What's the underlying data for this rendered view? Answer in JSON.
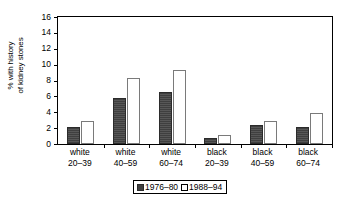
{
  "chart_data": {
    "type": "bar",
    "title": "",
    "xlabel": "",
    "ylabel": "% with history of kidney stones",
    "ylabel_line1": "% with history",
    "ylabel_line2": "of kidney stones",
    "ylim": [
      0,
      16
    ],
    "ytick_values": [
      0,
      2,
      4,
      6,
      8,
      10,
      12,
      14,
      16
    ],
    "ytick_labels": [
      "0",
      "2",
      "4",
      "6",
      "8",
      "10",
      "12",
      "14",
      "16"
    ],
    "grid": false,
    "legend_position": "bottom-center",
    "categories": [
      "white 20–39",
      "white 40–59",
      "white 60–74",
      "black 20–39",
      "black 40–59",
      "black 60–74"
    ],
    "category_lines": [
      [
        "white",
        "20–39"
      ],
      [
        "white",
        "40–59"
      ],
      [
        "white",
        "60–74"
      ],
      [
        "black",
        "20–39"
      ],
      [
        "black",
        "40–59"
      ],
      [
        "black",
        "60–74"
      ]
    ],
    "series": [
      {
        "name": "1976–80",
        "color": "#4d4d4d",
        "values": [
          2.2,
          5.8,
          6.6,
          0.7,
          2.4,
          2.1
        ]
      },
      {
        "name": "1988–94",
        "color": "#ffffff",
        "values": [
          2.9,
          8.3,
          9.3,
          1.1,
          2.9,
          3.9
        ]
      }
    ]
  },
  "legend": {
    "series_1_label": "1976–80",
    "series_2_label": "1988–94"
  },
  "axis": {
    "y_label_line_1": "% with history",
    "y_label_line_2": "of kidney stones"
  }
}
